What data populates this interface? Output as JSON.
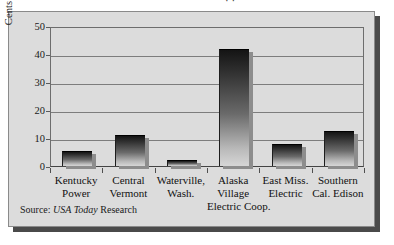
{
  "figure": {
    "clipped_title_fragment": "·     ·",
    "source_prefix": "Source:",
    "source_italic": "USA Today",
    "source_suffix": "Research",
    "colors": {
      "panel_background": "#dcdcdc",
      "frame_border": "#8a8a8a",
      "drop_shadow": "#4a4a4a",
      "gridline": "#7d7d7d",
      "bar_top": "#141414",
      "bar_bottom": "#d6d6d6",
      "text": "#111111"
    }
  },
  "chart_data": {
    "type": "bar",
    "title": "",
    "xlabel": "",
    "ylabel": "Cents per Kilowatt-hour",
    "ylim": [
      0,
      50
    ],
    "yticks": [
      0,
      10,
      20,
      30,
      40,
      50
    ],
    "ytick_labels": [
      "0",
      "10",
      "20",
      "30",
      "40",
      "50"
    ],
    "grid": true,
    "legend": false,
    "categories": [
      "Kentucky Power",
      "Central Vermont",
      "Waterville, Wash.",
      "Alaska Village Electric Coop.",
      "East Miss. Electric",
      "Southern Cal. Edison"
    ],
    "category_lines": [
      [
        "Kentucky",
        "Power"
      ],
      [
        "Central",
        "Vermont"
      ],
      [
        "Waterville,",
        "Wash."
      ],
      [
        "Alaska",
        "Village",
        "Electric Coop."
      ],
      [
        "East Miss.",
        "Electric"
      ],
      [
        "Southern",
        "Cal. Edison"
      ]
    ],
    "values": [
      5.3,
      11.0,
      2.0,
      41.7,
      8.0,
      12.5
    ],
    "series": [
      {
        "name": "Cents per Kilowatt-hour",
        "values": [
          5.3,
          11.0,
          2.0,
          41.7,
          8.0,
          12.5
        ]
      }
    ],
    "source": "Source: USA Today Research"
  }
}
